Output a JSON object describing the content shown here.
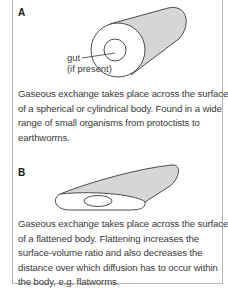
{
  "panels": [
    {
      "label": "A",
      "diagram": "cylindrical-body",
      "callout": {
        "line1": "gut",
        "line2": "(if present)"
      },
      "description_lines": [
        "Gaseous exchange takes place across the surface",
        "of a spherical or cylindrical body. Found in a wide",
        "range of small organisms from protoctists to",
        "earthworms."
      ]
    },
    {
      "label": "B",
      "diagram": "flattened-body",
      "description_lines": [
        "Gaseous exchange takes place across the surface",
        "of a flattened body. Flattening increases the",
        "surface-volume ratio and also decreases the",
        "distance over which diffusion has to occur within",
        "the body, e.g. flatworms."
      ]
    }
  ],
  "colors": {
    "shading": "#d6d6d6",
    "outline": "#3a3a3a",
    "border": "#b8b8b8",
    "text": "#3a3a3a"
  }
}
